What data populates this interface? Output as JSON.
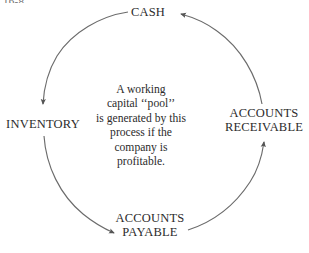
{
  "figure": {
    "clipped_tag": "16-8."
  },
  "diagram": {
    "type": "cycle",
    "shape": "circle",
    "stroke_color": "#6b6b6b",
    "text_color": "#2b2b2b",
    "background_color": "#ffffff",
    "center_x": 153,
    "center_y": 126,
    "radius": 110,
    "nodes": [
      {
        "id": "cash",
        "label": "CASH",
        "position": "top"
      },
      {
        "id": "inventory",
        "label": "INVENTORY",
        "position": "left"
      },
      {
        "id": "accounts-receivable",
        "label_line1": "ACCOUNTS",
        "label_line2": "RECEIVABLE",
        "position": "right"
      },
      {
        "id": "accounts-payable",
        "label_line1": "ACCOUNTS",
        "label_line2": "PAYABLE",
        "position": "bottom"
      }
    ],
    "arrows": [
      {
        "from": "cash",
        "to": "inventory",
        "direction": "counterclockwise",
        "arrowhead": "down-into-inventory"
      },
      {
        "from": "inventory",
        "to": "accounts-payable",
        "direction": "counterclockwise",
        "arrowhead": "right-into-payable"
      },
      {
        "from": "accounts-payable",
        "to": "accounts-receivable",
        "direction": "counterclockwise",
        "arrowhead": "up-into-receivable"
      },
      {
        "from": "accounts-receivable",
        "to": "cash",
        "direction": "counterclockwise",
        "arrowhead": "left-into-cash"
      }
    ]
  },
  "caption": {
    "lines": [
      "A working",
      "capital ‘‘pool’’",
      "is generated by this",
      "process if the",
      "company is",
      "profitable."
    ],
    "line1": "A working",
    "line2": "capital ‘‘pool’’",
    "line3": "is generated by this",
    "line4": "process if the",
    "line5": "company is",
    "line6": "profitable."
  }
}
